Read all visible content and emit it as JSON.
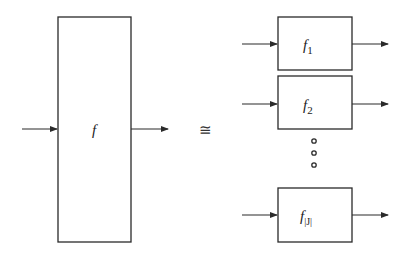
{
  "diagram": {
    "colors": {
      "stroke": "#2a2a2a",
      "background": "#ffffff"
    },
    "left": {
      "label": "f",
      "box": {
        "x": 58,
        "y": 17,
        "w": 73,
        "h": 225
      },
      "arrow_y": 129
    },
    "relation": {
      "symbol": "≅"
    },
    "right": {
      "boxes": [
        {
          "label": "f",
          "subscript": "1",
          "x": 278,
          "y": 17,
          "w": 74,
          "h": 53,
          "arrow_y": 44
        },
        {
          "label": "f",
          "subscript": "2",
          "x": 278,
          "y": 76,
          "w": 74,
          "h": 53,
          "arrow_y": 104
        },
        {
          "label": "f",
          "subscript": "|J|",
          "x": 278,
          "y": 188,
          "w": 74,
          "h": 54,
          "arrow_y": 215
        }
      ],
      "ellipsis": {
        "count": 3,
        "x": 314,
        "ys": [
          141,
          152,
          165
        ]
      }
    }
  }
}
